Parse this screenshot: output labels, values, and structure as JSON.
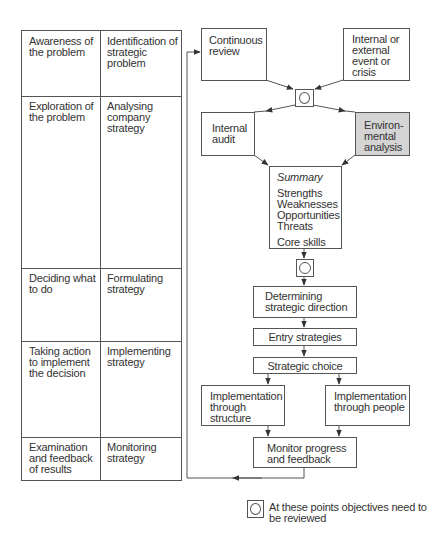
{
  "table": {
    "rows": [
      {
        "stage": "Awareness of the problem",
        "strategy": "Identification of strategic problem"
      },
      {
        "stage": "Exploration of the problem",
        "strategy": "Analysing company strategy"
      },
      {
        "stage": "Deciding what to do",
        "strategy": "Formulating strategy"
      },
      {
        "stage": "Taking action to implement the decision",
        "strategy": "Implementing strategy"
      },
      {
        "stage": "Examination and feedback of results",
        "strategy": "Monitoring strategy"
      }
    ]
  },
  "flow": {
    "continuous_review": "Continuous review",
    "internal_external": "Internal or external event or crisis",
    "internal_audit": "Internal audit",
    "environmental_analysis": "Environ-mental analysis",
    "summary": {
      "title": "Summary",
      "items": [
        "Strengths",
        "Weaknesses",
        "Opportunities",
        "Threats"
      ],
      "extra": "Core skills"
    },
    "determining_direction": "Determining strategic direction",
    "entry_strategies": "Entry strategies",
    "strategic_choice": "Strategic choice",
    "impl_structure": "Implementation through structure",
    "impl_people": "Implementation through people",
    "monitor": "Monitor progress and feedback"
  },
  "legend": {
    "symbol": "review-point",
    "text": "At these points objectives need to be reviewed"
  },
  "colors": {
    "line": "#555555",
    "highlight_fill": "#d4d4d4"
  }
}
